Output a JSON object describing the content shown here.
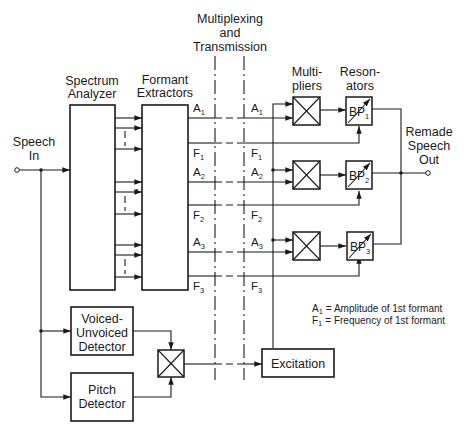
{
  "labels": {
    "multiplexing_line1": "Multiplexing",
    "multiplexing_line2": "and",
    "multiplexing_line3": "Transmission",
    "spectrum_line1": "Spectrum",
    "spectrum_line2": "Analyzer",
    "formant_line1": "Formant",
    "formant_line2": "Extractors",
    "multipliers_line1": "Multi-",
    "multipliers_line2": "pliers",
    "resonators_line1": "Reson-",
    "resonators_line2": "ators",
    "speech_in_line1": "Speech",
    "speech_in_line2": "In",
    "remade_line1": "Remade",
    "remade_line2": "Speech",
    "remade_line3": "Out",
    "voiced_line1": "Voiced-",
    "voiced_line2": "Unvoiced",
    "voiced_line3": "Detector",
    "pitch_line1": "Pitch",
    "pitch_line2": "Detector",
    "excitation": "Excitation"
  },
  "signals": {
    "A": "A",
    "F": "F",
    "BP": "BP",
    "idx1": "1",
    "idx2": "2",
    "idx3": "3"
  },
  "resonators": [
    {
      "label": "BP",
      "index": "1"
    },
    {
      "label": "BP",
      "index": "2"
    },
    {
      "label": "BP",
      "index": "3"
    }
  ],
  "legend": {
    "line1_sym": "A",
    "line1_sub": "1",
    "line1_text": "= Amplitude of 1st formant",
    "line2_sym": "F",
    "line2_sub": "1",
    "line2_text": "= Frequency of 1st formant"
  },
  "colors": {
    "ink": "#1a1a1a",
    "background": "#ffffff"
  }
}
